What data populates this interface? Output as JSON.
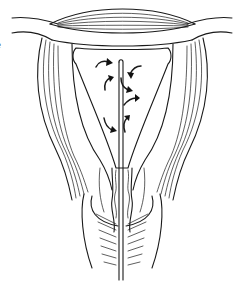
{
  "figure": {
    "edge_text_fragment": "e",
    "elements": [
      {
        "name": "fundus-myometrium",
        "description": "lens-shaped striated muscle band at top"
      },
      {
        "name": "fallopian-tube-left",
        "description": "tube extending to upper left"
      },
      {
        "name": "fallopian-tube-right",
        "description": "tube extending to upper right"
      },
      {
        "name": "uterine-cavity",
        "description": "inverted triangular cavity"
      },
      {
        "name": "catheter",
        "description": "vertical rod through cervix into cavity"
      },
      {
        "name": "flow-arrows",
        "count": 7,
        "description": "curved black arrows showing swirling flow"
      },
      {
        "name": "cervix",
        "description": "narrow canal with wavy mucosa"
      },
      {
        "name": "vagina",
        "description": "rugae folds at bottom"
      }
    ],
    "colors": {
      "line": "#1a1a1a",
      "background": "#ffffff"
    }
  }
}
